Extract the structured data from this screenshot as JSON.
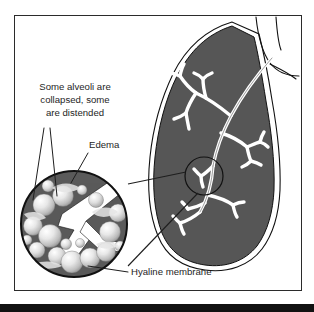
{
  "colors": {
    "frame_border": "#2b2b2b",
    "background": "#ffffff",
    "lung_body": "#565656",
    "lung_outline": "#111111",
    "lung_halo": "#ffffff",
    "airway_fill": "#ffffff",
    "airway_outline": "#111111",
    "inset_background": "#5a5a5a",
    "inset_border": "#111111",
    "alveoli_light": "#f2f2f2",
    "alveoli_shadow": "#8c8c8c",
    "membrane_white": "#ffffff",
    "label_text": "#1e1e1e",
    "leader_line": "#1e1e1e",
    "bottom_bar": "#121212"
  },
  "labels": {
    "alveoli": {
      "name": "alveoli-callout",
      "lines": [
        "Some alveoli are",
        "collapsed, some",
        "are distended"
      ],
      "align": "center"
    },
    "edema": {
      "name": "edema-callout",
      "text": "Edema"
    },
    "hyaline": {
      "name": "hyaline-membrane-callout",
      "text": "Hyaline membrane"
    }
  },
  "anatomy": {
    "lung": "lung-silhouette",
    "trachea": "trachea-outline",
    "bronchial_tree": "bronchial-tree",
    "focus_circle": "terminal-bronchiole-focus-circle",
    "magnifier": "alveoli-magnified-inset"
  }
}
